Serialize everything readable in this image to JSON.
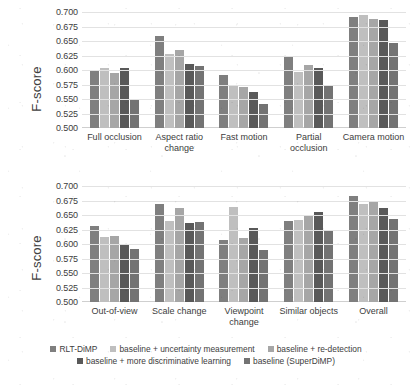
{
  "chart_data": [
    {
      "type": "bar",
      "panel": "top",
      "title": "",
      "xlabel": "",
      "ylabel": "F-score",
      "ylim": [
        0.5,
        0.7
      ],
      "yticks": [
        "0.700",
        "0.675",
        "0.650",
        "0.625",
        "0.600",
        "0.575",
        "0.550",
        "0.525",
        "0.500"
      ],
      "ytick_values": [
        0.7,
        0.675,
        0.65,
        0.625,
        0.6,
        0.575,
        0.55,
        0.525,
        0.5
      ],
      "grid": true,
      "legend_position": "bottom",
      "categories": [
        "Full occlusion",
        "Aspect ratio change",
        "Fast motion",
        "Partial occlusion",
        "Camera motion"
      ],
      "series": [
        {
          "name": "RLT-DiMP",
          "color": "#7f7f7f",
          "values": [
            0.6,
            0.658,
            0.592,
            0.625,
            0.692
          ]
        },
        {
          "name": "baseline + uncertainty measurement",
          "color": "#bfbfbf",
          "values": [
            0.604,
            0.627,
            0.573,
            0.596,
            0.695
          ]
        },
        {
          "name": "baseline + re-detection",
          "color": "#a6a6a6",
          "values": [
            0.595,
            0.635,
            0.57,
            0.608,
            0.688
          ]
        },
        {
          "name": "baseline + more discriminative learning",
          "color": "#595959",
          "values": [
            0.603,
            0.61,
            0.562,
            0.603,
            0.686
          ]
        },
        {
          "name": "baseline (SuperDiMP)",
          "color": "#737373",
          "values": [
            0.549,
            0.607,
            0.541,
            0.574,
            0.646
          ]
        }
      ]
    },
    {
      "type": "bar",
      "panel": "bottom",
      "title": "",
      "xlabel": "",
      "ylabel": "F-score",
      "ylim": [
        0.5,
        0.7
      ],
      "yticks": [
        "0.700",
        "0.675",
        "0.650",
        "0.625",
        "0.600",
        "0.575",
        "0.550",
        "0.525",
        "0.500"
      ],
      "ytick_values": [
        0.7,
        0.675,
        0.65,
        0.625,
        0.6,
        0.575,
        0.55,
        0.525,
        0.5
      ],
      "grid": true,
      "legend_position": "bottom",
      "categories": [
        "Out-of-view",
        "Scale change",
        "Viewpoint change",
        "Similar objects",
        "Overall"
      ],
      "series": [
        {
          "name": "RLT-DiMP",
          "color": "#7f7f7f",
          "values": [
            0.631,
            0.669,
            0.607,
            0.639,
            0.682
          ]
        },
        {
          "name": "baseline + uncertainty measurement",
          "color": "#bfbfbf",
          "values": [
            0.612,
            0.639,
            0.663,
            0.642,
            0.669
          ]
        },
        {
          "name": "baseline + re-detection",
          "color": "#a6a6a6",
          "values": [
            0.613,
            0.662,
            0.611,
            0.648,
            0.675
          ]
        },
        {
          "name": "baseline + more discriminative learning",
          "color": "#595959",
          "values": [
            0.6,
            0.637,
            0.628,
            0.656,
            0.662
          ]
        },
        {
          "name": "baseline (SuperDiMP)",
          "color": "#737373",
          "values": [
            0.592,
            0.638,
            0.589,
            0.625,
            0.643
          ]
        }
      ]
    }
  ],
  "legend": {
    "row1": [
      {
        "label": "RLT-DiMP",
        "color": "#7f7f7f"
      },
      {
        "label": "baseline + uncertainty measurement",
        "color": "#bfbfbf"
      },
      {
        "label": "baseline + re-detection",
        "color": "#a6a6a6"
      }
    ],
    "row2": [
      {
        "label": "baseline + more discriminative learning",
        "color": "#595959"
      },
      {
        "label": "baseline (SuperDiMP)",
        "color": "#737373"
      }
    ]
  }
}
